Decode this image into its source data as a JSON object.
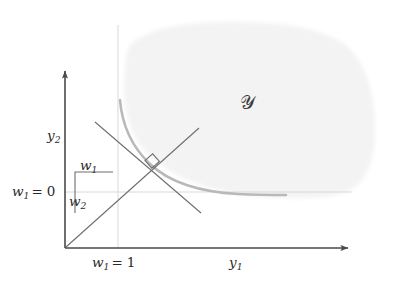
{
  "figure": {
    "colors": {
      "axis": "#4a4a4a",
      "curve": "#b9b9b9",
      "line": "#6e6e6e",
      "gridline": "#d9d9d9",
      "region_fill": "#f3f3f3",
      "text": "#2b2b2b",
      "background": "#ffffff"
    }
  },
  "axes": {
    "x_label": {
      "base": "y",
      "sub": "1"
    },
    "y_label": {
      "base": "y",
      "sub": "2"
    },
    "origin": {
      "x": 65,
      "y": 248
    },
    "x_arrow_end": {
      "x": 352,
      "y": 248
    },
    "y_arrow_end": {
      "x": 65,
      "y": 66
    }
  },
  "labels": {
    "y2": {
      "base": "y",
      "sub": "2"
    },
    "y1": {
      "base": "y",
      "sub": "1"
    },
    "w1_zero": {
      "base": "w",
      "sub": "1",
      "op": "=",
      "value": "0"
    },
    "w1_one": {
      "base": "w",
      "sub": "1",
      "op": "=",
      "value": "1"
    },
    "w1_step": {
      "base": "w",
      "sub": "1"
    },
    "w2_step": {
      "base": "w",
      "sub": "2"
    },
    "region": "𝒴"
  },
  "gridlines": {
    "vertical_w1_equals_1": {
      "x": 118,
      "y_top": 25,
      "y_bottom": 248
    },
    "horizontal_w1_equals_0": {
      "y": 192,
      "x_left": 65,
      "x_right": 352
    }
  },
  "region": {
    "name": "feasible-set-Y",
    "fill": "#f3f3f3",
    "label": "𝒴",
    "label_position": {
      "x": 248,
      "y": 104
    }
  },
  "curve": {
    "name": "pareto-frontier",
    "stroke": "#b9b9b9",
    "stroke_width": 2.6,
    "start": {
      "x": 120,
      "y": 100
    },
    "end": {
      "x": 286,
      "y": 195
    }
  },
  "support_line": {
    "name": "supporting-hyperplane",
    "stroke": "#6e6e6e",
    "from": {
      "x": 95,
      "y": 122
    },
    "to": {
      "x": 201,
      "y": 213
    }
  },
  "ray": {
    "name": "weight-direction-ray",
    "stroke": "#6e6e6e",
    "from": {
      "x": 66,
      "y": 247
    },
    "to": {
      "x": 199,
      "y": 128
    }
  },
  "step_construction": {
    "name": "slope-step-triangle",
    "horizontal_from": {
      "x": 75,
      "y": 172
    },
    "horizontal_to": {
      "x": 113,
      "y": 172
    },
    "vertical_from": {
      "x": 75,
      "y": 172
    },
    "vertical_to": {
      "x": 75,
      "y": 213
    }
  },
  "right_angle_marker": {
    "name": "perpendicular-marker",
    "center": {
      "x": 152,
      "y": 167
    },
    "size": 11
  }
}
